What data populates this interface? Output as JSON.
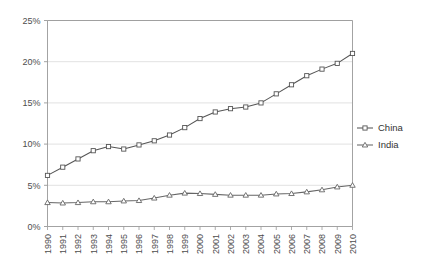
{
  "chart_data": {
    "type": "line",
    "title": "",
    "subtitle": "",
    "xlabel": "",
    "ylabel": "",
    "x": [
      1990,
      1991,
      1992,
      1993,
      1994,
      1995,
      1996,
      1997,
      1998,
      1999,
      2000,
      2001,
      2002,
      2003,
      2004,
      2005,
      2006,
      2007,
      2008,
      2009,
      2010
    ],
    "categories": [
      "1990",
      "1991",
      "1992",
      "1993",
      "1994",
      "1995",
      "1996",
      "1997",
      "1998",
      "1999",
      "2000",
      "2001",
      "2002",
      "2003",
      "2004",
      "2005",
      "2006",
      "2007",
      "2008",
      "2009",
      "2010"
    ],
    "series": [
      {
        "name": "China",
        "marker": "square",
        "color": "#555555",
        "values": [
          6.2,
          7.2,
          8.2,
          9.2,
          9.7,
          9.4,
          9.9,
          10.4,
          11.1,
          12.0,
          13.1,
          13.9,
          14.3,
          14.5,
          15.0,
          16.1,
          17.2,
          18.3,
          19.1,
          19.8,
          21.0
        ]
      },
      {
        "name": "India",
        "marker": "triangle",
        "color": "#666666",
        "values": [
          2.9,
          2.85,
          2.9,
          3.0,
          3.0,
          3.1,
          3.15,
          3.45,
          3.8,
          4.05,
          4.0,
          3.9,
          3.8,
          3.8,
          3.8,
          3.95,
          4.0,
          4.2,
          4.45,
          4.8,
          5.0
        ]
      }
    ],
    "ylim": [
      0,
      25
    ],
    "yticks": [
      0,
      5,
      10,
      15,
      20,
      25
    ],
    "ytick_labels": [
      "0%",
      "5%",
      "10%",
      "15%",
      "20%",
      "25%"
    ],
    "grid": "horizontal",
    "legend_position": "right",
    "legend_entries": [
      "China",
      "India"
    ],
    "axis_color": "#999999",
    "grid_color": "#d9d9d9",
    "background": "#ffffff"
  }
}
